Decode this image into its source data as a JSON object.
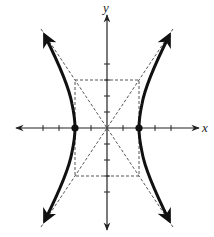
{
  "diagram": {
    "type": "hyperbola",
    "equation": "x^2/4 - y^2/9 = 1",
    "a": 2,
    "b": 3,
    "x_axis_label": "x",
    "y_axis_label": "y",
    "vertices": [
      [
        -2,
        0
      ],
      [
        2,
        0
      ]
    ],
    "asymptote_slopes": [
      1.5,
      -1.5
    ],
    "fundamental_rectangle": {
      "x": [
        -2,
        2
      ],
      "y": [
        -3,
        3
      ]
    },
    "x_ticks": [
      -4,
      -3,
      -2,
      -1,
      1,
      2,
      3,
      4
    ],
    "y_ticks": [
      -4,
      -3,
      -2,
      -1,
      1,
      2,
      3,
      4
    ],
    "colors": {
      "curve": "#111111",
      "dashed": "#555555",
      "axis": "#222222"
    }
  }
}
